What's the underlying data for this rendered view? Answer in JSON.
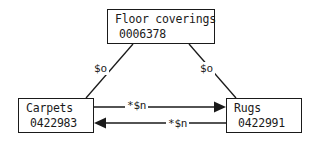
{
  "diagram": {
    "type": "concept-relation-graph",
    "background_color": "#ffffff",
    "line_color": "#1a1a1a",
    "nodes": [
      {
        "id": "floor-coverings",
        "title": "Floor coverings",
        "code": "0006378"
      },
      {
        "id": "carpets",
        "title": "Carpets",
        "code": "0422983"
      },
      {
        "id": "rugs",
        "title": "Rugs",
        "code": "0422991"
      }
    ],
    "edges": [
      {
        "id": "floor-coverings-to-carpets",
        "from": "floor-coverings",
        "to": "carpets",
        "label": "$o",
        "arrowhead": "none"
      },
      {
        "id": "floor-coverings-to-rugs",
        "from": "floor-coverings",
        "to": "rugs",
        "label": "$o",
        "arrowhead": "none"
      },
      {
        "id": "carpets-to-rugs",
        "from": "carpets",
        "to": "rugs",
        "label": "*$n",
        "arrowhead": "right"
      },
      {
        "id": "rugs-to-carpets",
        "from": "rugs",
        "to": "carpets",
        "label": "*$n",
        "arrowhead": "left"
      }
    ]
  }
}
